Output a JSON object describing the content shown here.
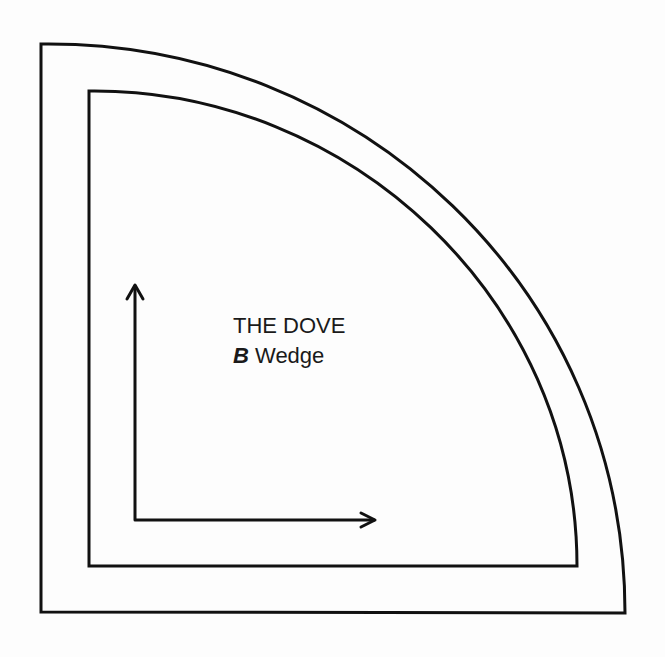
{
  "diagram": {
    "title": "THE DOVE",
    "wedge_letter": "B",
    "wedge_label": "Wedge",
    "stroke_color": "#111111",
    "background": "#fdfdfd",
    "shapes": {
      "outer_wedge": "quarter-round template outline",
      "inner_wedge": "seam line quarter-round",
      "grain_arrows": [
        "up",
        "right"
      ]
    }
  }
}
